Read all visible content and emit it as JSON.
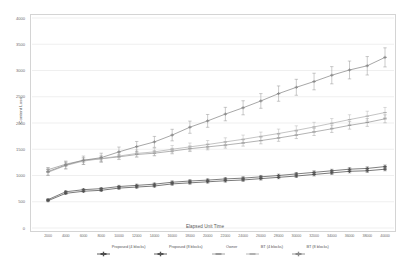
{
  "chart_data": {
    "type": "line",
    "title": "",
    "xlabel": "Elapsed Unit Time",
    "ylabel": "Content Loss",
    "grid": true,
    "legend_position": "bottom",
    "error_bars": true,
    "xlim": [
      0,
      21
    ],
    "ylim": [
      0,
      4000
    ],
    "yticks": [
      0,
      500,
      1000,
      1500,
      2000,
      2500,
      3000,
      3500,
      4000
    ],
    "categories": [
      2000,
      4000,
      6000,
      8000,
      10000,
      12000,
      14000,
      16000,
      18000,
      20000,
      22000,
      24000,
      26000,
      28000,
      30000,
      32000,
      34000,
      36000,
      38000,
      40000
    ],
    "series": [
      {
        "name": "Proposed (4 blocks)",
        "color": "#4d4d4d",
        "marker": "cross",
        "values": [
          520,
          660,
          700,
          718,
          760,
          780,
          800,
          840,
          860,
          880,
          900,
          915,
          940,
          965,
          990,
          1020,
          1050,
          1080,
          1090,
          1120
        ],
        "errors": [
          18,
          20,
          20,
          20,
          22,
          22,
          22,
          24,
          24,
          24,
          25,
          25,
          26,
          26,
          27,
          28,
          28,
          29,
          29,
          30
        ]
      },
      {
        "name": "Proposed (8 blocks)",
        "color": "#545454",
        "marker": "cross",
        "values": [
          540,
          690,
          730,
          750,
          790,
          812,
          835,
          872,
          895,
          912,
          935,
          950,
          975,
          1000,
          1030,
          1060,
          1090,
          1120,
          1135,
          1170
        ],
        "errors": [
          18,
          20,
          20,
          20,
          22,
          22,
          22,
          24,
          24,
          24,
          25,
          25,
          26,
          26,
          27,
          28,
          28,
          29,
          29,
          30
        ]
      },
      {
        "name": "Owner",
        "color": "#9a9a9a",
        "marker": "dash",
        "values": [
          1110,
          1215,
          1290,
          1320,
          1355,
          1400,
          1425,
          1465,
          1510,
          1545,
          1580,
          1620,
          1665,
          1715,
          1770,
          1830,
          1890,
          1955,
          2010,
          2080
        ],
        "errors": [
          40,
          42,
          44,
          45,
          46,
          48,
          50,
          52,
          54,
          56,
          58,
          60,
          62,
          64,
          66,
          68,
          70,
          72,
          74,
          76
        ]
      },
      {
        "name": "BT (4 blocks)",
        "color": "#b0b0b0",
        "marker": "dash",
        "values": [
          1060,
          1190,
          1275,
          1320,
          1370,
          1420,
          1450,
          1500,
          1545,
          1590,
          1640,
          1690,
          1745,
          1800,
          1860,
          1925,
          1995,
          2065,
          2130,
          2200
        ],
        "errors": [
          60,
          62,
          64,
          64,
          66,
          68,
          70,
          72,
          74,
          76,
          78,
          80,
          82,
          84,
          86,
          88,
          90,
          92,
          94,
          96
        ]
      },
      {
        "name": "BT (8 blocks)",
        "color": "#8a8a8a",
        "marker": "cross",
        "values": [
          1075,
          1200,
          1290,
          1340,
          1450,
          1550,
          1640,
          1770,
          1920,
          2040,
          2170,
          2290,
          2420,
          2560,
          2680,
          2790,
          2910,
          3010,
          3090,
          3250
        ],
        "errors": [
          70,
          75,
          80,
          85,
          92,
          98,
          104,
          110,
          116,
          122,
          128,
          134,
          140,
          146,
          152,
          158,
          164,
          170,
          176,
          182
        ]
      }
    ]
  },
  "axes": {
    "y_title": "Content Loss",
    "x_title": "Elapsed Unit Time"
  }
}
